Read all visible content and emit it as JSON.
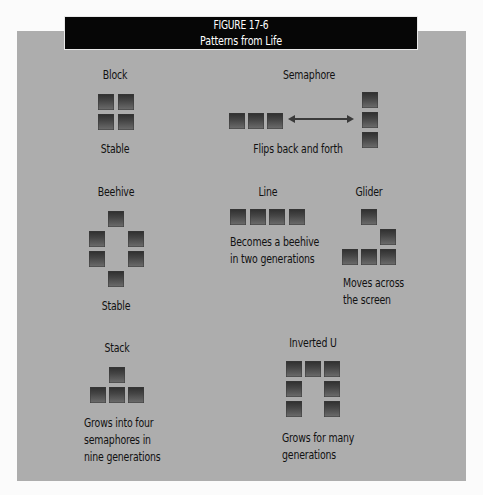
{
  "figure": {
    "number": "FIGURE 17-6",
    "title": "Patterns from Life"
  },
  "colors": {
    "title_bar": "#060606",
    "panel": "#adadad",
    "cell_dark": "#2e2e2e",
    "cell_light": "#6d6d6d"
  },
  "patterns": {
    "block": {
      "name": "Block",
      "description": "Stable",
      "cells": [
        [
          98,
          94
        ],
        [
          118,
          94
        ],
        [
          98,
          114
        ],
        [
          118,
          114
        ]
      ]
    },
    "semaphore": {
      "name": "Semaphore",
      "description": "Flips back and forth",
      "horizontal_cells": [
        [
          229,
          113
        ],
        [
          248,
          113
        ],
        [
          267,
          113
        ]
      ],
      "vertical_cells": [
        [
          362,
          92
        ],
        [
          362,
          112
        ],
        [
          362,
          132
        ]
      ],
      "arrow": "double-headed"
    },
    "beehive": {
      "name": "Beehive",
      "description": "Stable",
      "cells": [
        [
          108,
          211
        ],
        [
          89,
          231
        ],
        [
          128,
          231
        ],
        [
          89,
          251
        ],
        [
          128,
          251
        ],
        [
          108,
          271
        ]
      ]
    },
    "line": {
      "name": "Line",
      "description_line1": "Becomes a beehive",
      "description_line2": "in two generations",
      "cells": [
        [
          230,
          209
        ],
        [
          250,
          209
        ],
        [
          269,
          209
        ],
        [
          289,
          209
        ]
      ]
    },
    "glider": {
      "name": "Glider",
      "description_line1": "Moves across",
      "description_line2": "the screen",
      "cells": [
        [
          361,
          209
        ],
        [
          380,
          229
        ],
        [
          342,
          249
        ],
        [
          361,
          249
        ],
        [
          380,
          249
        ]
      ]
    },
    "stack": {
      "name": "Stack",
      "description_line1": "Grows into four",
      "description_line2": "semaphores in",
      "description_line3": "nine generations",
      "cells": [
        [
          109,
          367
        ],
        [
          90,
          387
        ],
        [
          109,
          387
        ],
        [
          128,
          387
        ]
      ]
    },
    "inverted_u": {
      "name": "Inverted U",
      "description_line1": "Grows for many",
      "description_line2": "generations",
      "cells": [
        [
          286,
          361
        ],
        [
          305,
          361
        ],
        [
          324,
          361
        ],
        [
          286,
          381
        ],
        [
          324,
          381
        ],
        [
          286,
          401
        ],
        [
          324,
          401
        ]
      ]
    }
  }
}
